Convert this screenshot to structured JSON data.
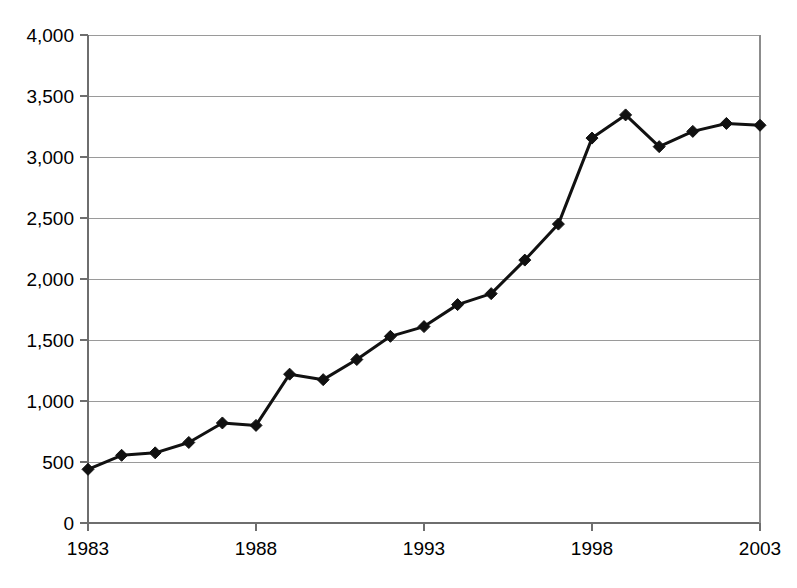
{
  "chart_data": {
    "type": "line",
    "title": "",
    "subtitle": "",
    "xlabel": "",
    "ylabel": "",
    "x": [
      1983,
      1984,
      1985,
      1986,
      1987,
      1988,
      1989,
      1990,
      1991,
      1992,
      1993,
      1994,
      1995,
      1996,
      1997,
      1998,
      1999,
      2000,
      2001,
      2002,
      2003
    ],
    "values": [
      440,
      555,
      575,
      660,
      820,
      800,
      1220,
      1175,
      1340,
      1530,
      1610,
      1790,
      1880,
      2155,
      2450,
      3155,
      3345,
      3085,
      3210,
      3275,
      3260
    ],
    "series": [
      {
        "name": "",
        "values": [
          440,
          555,
          575,
          660,
          820,
          800,
          1220,
          1175,
          1340,
          1530,
          1610,
          1790,
          1880,
          2155,
          2450,
          3155,
          3345,
          3085,
          3210,
          3275,
          3260
        ]
      }
    ],
    "xlim": [
      1983,
      2003
    ],
    "ylim": [
      0,
      4000
    ],
    "xticks": [
      1983,
      1988,
      1993,
      1998,
      2003
    ],
    "xtick_labels": [
      "1983",
      "1988",
      "1993",
      "1998",
      "2003"
    ],
    "yticks": [
      0,
      500,
      1000,
      1500,
      2000,
      2500,
      3000,
      3500,
      4000
    ],
    "ytick_labels": [
      "0",
      "500",
      "1,000",
      "1,500",
      "2,000",
      "2,500",
      "3,000",
      "3,500",
      "4,000"
    ],
    "grid": "horizontal",
    "legend": "none",
    "marker": "diamond",
    "line_color": "#111111",
    "grid_color": "#9a9a9a",
    "axis_color": "#6e6e6e",
    "background_color": "#ffffff"
  }
}
